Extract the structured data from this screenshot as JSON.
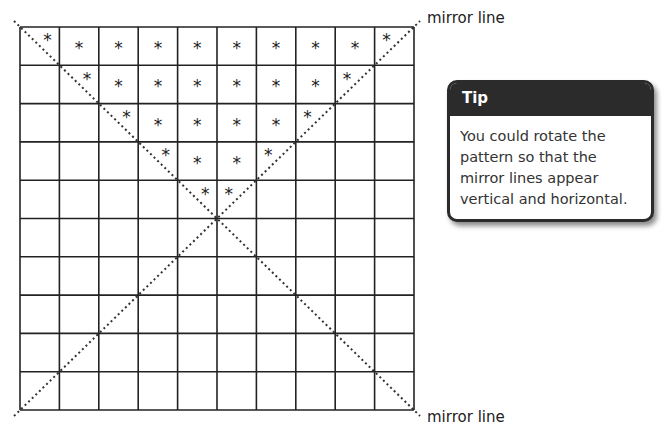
{
  "labels": {
    "top_mirror_line": "mirror line",
    "bottom_mirror_line": "mirror line"
  },
  "tip": {
    "title": "Tip",
    "text": "You could rotate the pattern so that the mirror lines appear vertical and horizontal."
  },
  "grid": {
    "rows": 10,
    "cols": 10,
    "symbol": "*",
    "stars": [
      [
        0,
        0,
        "diag-left"
      ],
      [
        0,
        1,
        "c"
      ],
      [
        0,
        2,
        "c"
      ],
      [
        0,
        3,
        "c"
      ],
      [
        0,
        4,
        "c"
      ],
      [
        0,
        5,
        "c"
      ],
      [
        0,
        6,
        "c"
      ],
      [
        0,
        7,
        "c"
      ],
      [
        0,
        8,
        "c"
      ],
      [
        0,
        9,
        "diag-right"
      ],
      [
        1,
        1,
        "diag-left"
      ],
      [
        1,
        2,
        "c"
      ],
      [
        1,
        3,
        "c"
      ],
      [
        1,
        4,
        "c"
      ],
      [
        1,
        5,
        "c"
      ],
      [
        1,
        6,
        "c"
      ],
      [
        1,
        7,
        "c"
      ],
      [
        1,
        8,
        "diag-right"
      ],
      [
        2,
        2,
        "diag-left"
      ],
      [
        2,
        3,
        "c"
      ],
      [
        2,
        4,
        "c"
      ],
      [
        2,
        5,
        "c"
      ],
      [
        2,
        6,
        "c"
      ],
      [
        2,
        7,
        "diag-right"
      ],
      [
        3,
        3,
        "diag-left"
      ],
      [
        3,
        4,
        "c"
      ],
      [
        3,
        5,
        "c"
      ],
      [
        3,
        6,
        "diag-right"
      ],
      [
        4,
        4,
        "diag-left"
      ],
      [
        4,
        5,
        "diag-right"
      ]
    ]
  }
}
